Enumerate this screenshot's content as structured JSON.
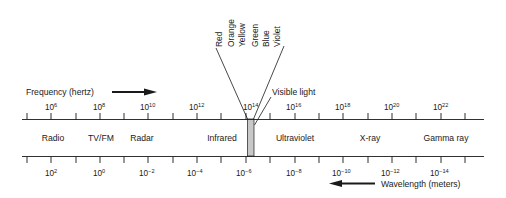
{
  "colors": {
    "line": "#1a1a1a",
    "visible_band_fill": "#c8c8c8",
    "background": "#ffffff"
  },
  "frequency_axis": {
    "label": "Frequency (hertz)",
    "direction": "increasing to the right",
    "ticks": [
      {
        "base": "10",
        "exp": "6"
      },
      {
        "base": "10",
        "exp": "8"
      },
      {
        "base": "10",
        "exp": "10"
      },
      {
        "base": "10",
        "exp": "12"
      },
      {
        "base": "10",
        "exp": "14"
      },
      {
        "base": "10",
        "exp": "16"
      },
      {
        "base": "10",
        "exp": "18"
      },
      {
        "base": "10",
        "exp": "20"
      },
      {
        "base": "10",
        "exp": "22"
      }
    ]
  },
  "wavelength_axis": {
    "label": "Wavelength (meters)",
    "direction": "decreasing to the right",
    "ticks": [
      {
        "base": "10",
        "exp": "2"
      },
      {
        "base": "10",
        "exp": "0"
      },
      {
        "base": "10",
        "exp": "−2"
      },
      {
        "base": "10",
        "exp": "−4"
      },
      {
        "base": "10",
        "exp": "−6"
      },
      {
        "base": "10",
        "exp": "−8"
      },
      {
        "base": "10",
        "exp": "−10"
      },
      {
        "base": "10",
        "exp": "−12"
      },
      {
        "base": "10",
        "exp": "−14"
      }
    ]
  },
  "bands": [
    {
      "name": "Radio"
    },
    {
      "name": "TV/FM"
    },
    {
      "name": "Radar"
    },
    {
      "name": "Infrared"
    },
    {
      "name": "Ultraviolet"
    },
    {
      "name": "X-ray"
    },
    {
      "name": "Gamma ray"
    }
  ],
  "visible_light": {
    "label": "Visible light",
    "colors": [
      "Red",
      "Orange",
      "Yellow",
      "Green",
      "Blue",
      "Violet"
    ]
  }
}
